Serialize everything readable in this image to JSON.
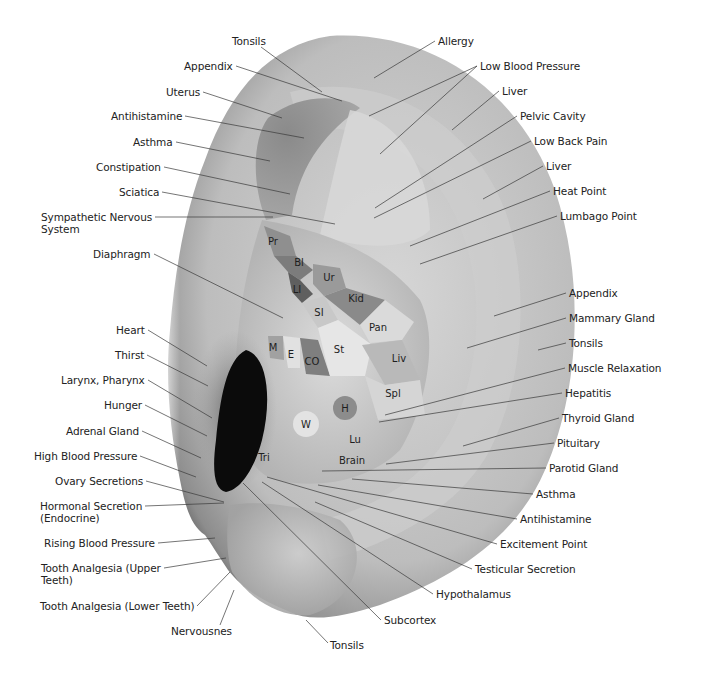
{
  "diagram": {
    "type": "auricular-reflexology-map",
    "colors": {
      "background": "#ffffff",
      "text": "#222222",
      "leader_line": "#3a3a3a",
      "ear_light": "#e4e4e4",
      "ear_mid": "#b7b7b7",
      "ear_dark": "#6f6f6f",
      "canal": "#0e0e0e"
    },
    "left_labels": [
      {
        "id": "tonsils-top",
        "text": "Tonsils",
        "x": 232,
        "y": 35,
        "align": "center",
        "tx": 322,
        "ty": 92
      },
      {
        "id": "appendix-top",
        "text": "Appendix",
        "x": 184,
        "y": 60,
        "align": "right",
        "tx": 342,
        "ty": 101
      },
      {
        "id": "uterus",
        "text": "Uterus",
        "x": 166,
        "y": 86,
        "align": "right",
        "tx": 282,
        "ty": 118
      },
      {
        "id": "antihistamine-upper",
        "text": "Antihistamine",
        "x": 111,
        "y": 110,
        "align": "right",
        "tx": 304,
        "ty": 138
      },
      {
        "id": "asthma-upper",
        "text": "Asthma",
        "x": 133,
        "y": 136,
        "align": "right",
        "tx": 270,
        "ty": 161
      },
      {
        "id": "constipation",
        "text": "Constipation",
        "x": 96,
        "y": 161,
        "align": "right",
        "tx": 290,
        "ty": 194
      },
      {
        "id": "sciatica",
        "text": "Sciatica",
        "x": 119,
        "y": 186,
        "align": "right",
        "tx": 335,
        "ty": 224
      },
      {
        "id": "sympathetic",
        "text": "Sympathetic Nervous\nSystem",
        "x": 41,
        "y": 211,
        "align": "right",
        "tx": 273,
        "ty": 217
      },
      {
        "id": "diaphragm",
        "text": "Diaphragm",
        "x": 93,
        "y": 248,
        "align": "right",
        "tx": 283,
        "ty": 318
      },
      {
        "id": "heart",
        "text": "Heart",
        "x": 116,
        "y": 324,
        "align": "right",
        "tx": 207,
        "ty": 366
      },
      {
        "id": "thirst",
        "text": "Thirst",
        "x": 115,
        "y": 349,
        "align": "right",
        "tx": 208,
        "ty": 386
      },
      {
        "id": "larynx",
        "text": "Larynx, Pharynx",
        "x": 61,
        "y": 374,
        "align": "right",
        "tx": 212,
        "ty": 418
      },
      {
        "id": "hunger",
        "text": "Hunger",
        "x": 104,
        "y": 399,
        "align": "right",
        "tx": 207,
        "ty": 436
      },
      {
        "id": "adrenal",
        "text": "Adrenal Gland",
        "x": 66,
        "y": 425,
        "align": "right",
        "tx": 201,
        "ty": 458
      },
      {
        "id": "high-bp",
        "text": "High Blood Pressure",
        "x": 34,
        "y": 450,
        "align": "right",
        "tx": 196,
        "ty": 477
      },
      {
        "id": "ovary",
        "text": "Ovary Secretions",
        "x": 55,
        "y": 475,
        "align": "right",
        "tx": 224,
        "ty": 502
      },
      {
        "id": "hormonal",
        "text": "Hormonal Secretion\n(Endocrine)",
        "x": 40,
        "y": 500,
        "align": "right",
        "tx": 224,
        "ty": 503
      },
      {
        "id": "rising-bp",
        "text": "Rising Blood Pressure",
        "x": 44,
        "y": 537,
        "align": "right",
        "tx": 215,
        "ty": 538
      },
      {
        "id": "tooth-upper",
        "text": "Tooth Analgesia (Upper\nTeeth)",
        "x": 41,
        "y": 562,
        "align": "right",
        "tx": 226,
        "ty": 558
      },
      {
        "id": "tooth-lower",
        "text": "Tooth Analgesia (Lower Teeth)",
        "x": 40,
        "y": 600,
        "align": "right",
        "tx": 230,
        "ty": 572
      },
      {
        "id": "nervousnes",
        "text": "Nervousnes",
        "x": 171,
        "y": 625,
        "align": "center",
        "tx": 234,
        "ty": 590
      }
    ],
    "right_labels": [
      {
        "id": "allergy",
        "text": "Allergy",
        "x": 438,
        "y": 35,
        "align": "left",
        "tx": 374,
        "ty": 78
      },
      {
        "id": "low-bp",
        "text": "Low Blood Pressure",
        "x": 480,
        "y": 60,
        "align": "left",
        "tx": 369,
        "ty": 116,
        "tx2": 380,
        "ty2": 154
      },
      {
        "id": "liver-upper",
        "text": "Liver",
        "x": 502,
        "y": 85,
        "align": "left",
        "tx": 452,
        "ty": 130
      },
      {
        "id": "pelvic",
        "text": "Pelvic Cavity",
        "x": 520,
        "y": 110,
        "align": "left",
        "tx": 375,
        "ty": 208
      },
      {
        "id": "low-back",
        "text": "Low Back Pain",
        "x": 534,
        "y": 135,
        "align": "left",
        "tx": 374,
        "ty": 218
      },
      {
        "id": "liver-mid",
        "text": "Liver",
        "x": 546,
        "y": 160,
        "align": "left",
        "tx": 483,
        "ty": 199
      },
      {
        "id": "heat",
        "text": "Heat Point",
        "x": 553,
        "y": 185,
        "align": "left",
        "tx": 410,
        "ty": 246
      },
      {
        "id": "lumbago",
        "text": "Lumbago Point",
        "x": 560,
        "y": 210,
        "align": "left",
        "tx": 420,
        "ty": 264
      },
      {
        "id": "appendix-right",
        "text": "Appendix",
        "x": 569,
        "y": 287,
        "align": "left",
        "tx": 494,
        "ty": 316
      },
      {
        "id": "mammary",
        "text": "Mammary Gland",
        "x": 569,
        "y": 312,
        "align": "left",
        "tx": 467,
        "ty": 348
      },
      {
        "id": "tonsils-right",
        "text": "Tonsils",
        "x": 569,
        "y": 337,
        "align": "left",
        "tx": 538,
        "ty": 350
      },
      {
        "id": "muscle",
        "text": "Muscle Relaxation",
        "x": 568,
        "y": 362,
        "align": "left",
        "tx": 385,
        "ty": 415
      },
      {
        "id": "hepatitis",
        "text": "Hepatitis",
        "x": 565,
        "y": 387,
        "align": "left",
        "tx": 379,
        "ty": 422
      },
      {
        "id": "thyroid",
        "text": "Thyroid Gland",
        "x": 562,
        "y": 412,
        "align": "left",
        "tx": 463,
        "ty": 446
      },
      {
        "id": "pituitary",
        "text": "Pituitary",
        "x": 557,
        "y": 437,
        "align": "left",
        "tx": 386,
        "ty": 464
      },
      {
        "id": "parotid",
        "text": "Parotid Gland",
        "x": 549,
        "y": 462,
        "align": "left",
        "tx": 322,
        "ty": 471
      },
      {
        "id": "asthma-lower",
        "text": "Asthma",
        "x": 536,
        "y": 488,
        "align": "left",
        "tx": 352,
        "ty": 479
      },
      {
        "id": "antihistamine-lower",
        "text": "Antihistamine",
        "x": 520,
        "y": 513,
        "align": "left",
        "tx": 318,
        "ty": 485
      },
      {
        "id": "excitement",
        "text": "Excitement Point",
        "x": 500,
        "y": 538,
        "align": "left",
        "tx": 267,
        "ty": 477
      },
      {
        "id": "testicular",
        "text": "Testicular Secretion",
        "x": 475,
        "y": 563,
        "align": "left",
        "tx": 315,
        "ty": 502
      },
      {
        "id": "hypothalamus",
        "text": "Hypothalamus",
        "x": 436,
        "y": 588,
        "align": "left",
        "tx": 262,
        "ty": 482
      },
      {
        "id": "subcortex",
        "text": "Subcortex",
        "x": 384,
        "y": 614,
        "align": "left",
        "tx": 243,
        "ty": 483
      },
      {
        "id": "tonsils-bottom",
        "text": "Tonsils",
        "x": 330,
        "y": 639,
        "align": "left",
        "tx": 306,
        "ty": 620
      }
    ],
    "zones": [
      {
        "abbr": "Pr",
        "x": 273,
        "y": 241
      },
      {
        "abbr": "Bl",
        "x": 299,
        "y": 262
      },
      {
        "abbr": "Ur",
        "x": 329,
        "y": 277
      },
      {
        "abbr": "LI",
        "x": 297,
        "y": 289
      },
      {
        "abbr": "Kid",
        "x": 356,
        "y": 298
      },
      {
        "abbr": "SI",
        "x": 319,
        "y": 312
      },
      {
        "abbr": "Pan",
        "x": 378,
        "y": 327
      },
      {
        "abbr": "M",
        "x": 273,
        "y": 347
      },
      {
        "abbr": "E",
        "x": 291,
        "y": 354
      },
      {
        "abbr": "CO",
        "x": 312,
        "y": 361
      },
      {
        "abbr": "St",
        "x": 339,
        "y": 349
      },
      {
        "abbr": "Liv",
        "x": 399,
        "y": 358
      },
      {
        "abbr": "Spl",
        "x": 393,
        "y": 393
      },
      {
        "abbr": "H",
        "x": 345,
        "y": 408
      },
      {
        "abbr": "W",
        "x": 306,
        "y": 424
      },
      {
        "abbr": "Lu",
        "x": 355,
        "y": 439
      },
      {
        "abbr": "Brain",
        "x": 352,
        "y": 460
      },
      {
        "abbr": "Tri",
        "x": 264,
        "y": 457
      }
    ]
  }
}
